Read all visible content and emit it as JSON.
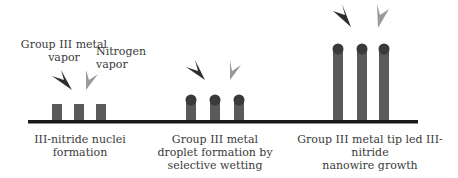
{
  "labels": {
    "metal_vapor": [
      "Group III metal",
      "vapor"
    ],
    "nitrogen_vapor": "Nitrogen vapor",
    "stage1": [
      "III-nitride nuclei",
      "formation"
    ],
    "stage2": [
      "Group III metal",
      "droplet formation by",
      "selective wetting"
    ],
    "stage3": [
      "Group III metal tip led III-nitride",
      "nanowire growth"
    ]
  },
  "colors": {
    "baseline": "#1a1a1a",
    "pillar": "#5a5a5a",
    "droplet": "#3a3a3a",
    "metal_arrow": "#2e2e2e",
    "nitrogen_arrow": "#9a9a9a"
  }
}
